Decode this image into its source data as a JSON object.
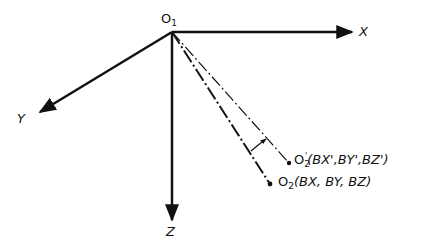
{
  "diagram": {
    "origin": {
      "base": "O",
      "sub": "1"
    },
    "axes": {
      "x": "X",
      "y": "Y",
      "z": "Z"
    },
    "point_prime": {
      "base": "O",
      "sub": "2",
      "sup": "'",
      "coords": "(BX',BY',BZ')"
    },
    "point": {
      "base": "O",
      "sub": "2",
      "coords": "(BX, BY, BZ)"
    },
    "colors": {
      "stroke": "#111111",
      "background": "#ffffff"
    }
  }
}
